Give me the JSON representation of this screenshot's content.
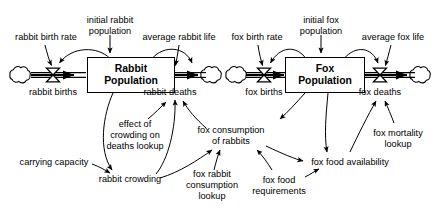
{
  "diagram": {
    "type": "stock-and-flow",
    "background_color": "#ffffff",
    "line_color": "#000000",
    "stocks": [
      {
        "id": "rabbit-population",
        "label": "Rabbit\nPopulation",
        "x": 131,
        "y": 75,
        "width": 88,
        "height": 36
      },
      {
        "id": "fox-population",
        "label": "Fox\nPopulation",
        "x": 325,
        "y": 75,
        "width": 80,
        "height": 36
      }
    ],
    "flows": [
      {
        "id": "rabbit-births",
        "label": "rabbit births",
        "valve_x": 53,
        "valve_y": 75,
        "label_x": 53,
        "label_y": 93
      },
      {
        "id": "rabbit-deaths",
        "label": "rabbit deaths",
        "valve_x": 200,
        "valve_y": 75,
        "label_x": 200,
        "label_y": 93
      },
      {
        "id": "fox-births",
        "label": "fox births",
        "valve_x": 264,
        "valve_y": 75,
        "label_x": 264,
        "label_y": 93
      },
      {
        "id": "fox-deaths",
        "label": "fox deaths",
        "valve_x": 380,
        "valve_y": 75,
        "label_x": 380,
        "label_y": 93
      }
    ],
    "variables": [
      {
        "id": "rabbit-birth-rate",
        "label": "rabbit birth rate",
        "x": 46,
        "y": 38
      },
      {
        "id": "initial-rabbit-population",
        "label": "initial rabbit\npopulation",
        "x": 110,
        "y": 26
      },
      {
        "id": "average-rabbit-life",
        "label": "average rabbit life",
        "x": 179,
        "y": 38
      },
      {
        "id": "fox-birth-rate",
        "label": "fox birth rate",
        "x": 257,
        "y": 38
      },
      {
        "id": "initial-fox-population",
        "label": "initial fox\npopulation",
        "x": 321,
        "y": 26
      },
      {
        "id": "average-fox-life",
        "label": "average fox life",
        "x": 393,
        "y": 38
      },
      {
        "id": "effect-of-crowding-on-deaths-lookup",
        "label": "effect of\ncrowding on\ndeaths lookup",
        "x": 135,
        "y": 136
      },
      {
        "id": "carrying-capacity",
        "label": "carrying capacity",
        "x": 54,
        "y": 163
      },
      {
        "id": "rabbit-crowding",
        "label": "rabbit crowding",
        "x": 130,
        "y": 180
      },
      {
        "id": "fox-consumption-of-rabbits",
        "label": "fox consumption\nof rabbits",
        "x": 231,
        "y": 136
      },
      {
        "id": "fox-rabbit-consumption-lookup",
        "label": "fox rabbit\nconsumption\nlookup",
        "x": 212,
        "y": 186
      },
      {
        "id": "fox-food-requirements",
        "label": "fox food\nrequirements",
        "x": 279,
        "y": 186
      },
      {
        "id": "fox-food-availability",
        "label": "fox food availability",
        "x": 350,
        "y": 163
      },
      {
        "id": "fox-mortality-lookup",
        "label": "fox mortality\nlookup",
        "x": 398,
        "y": 139
      }
    ],
    "clouds": [
      {
        "id": "cloud-rabbit-source",
        "x": 20,
        "y": 75
      },
      {
        "id": "cloud-rabbit-sink",
        "x": 211,
        "y": 75
      },
      {
        "id": "cloud-fox-source",
        "x": 236,
        "y": 75
      },
      {
        "id": "cloud-fox-sink",
        "x": 420,
        "y": 75
      }
    ]
  }
}
